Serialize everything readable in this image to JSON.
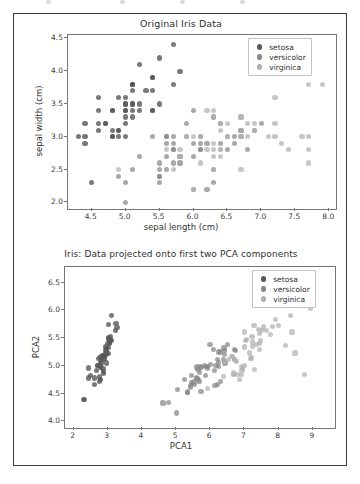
{
  "page": {
    "background_color": "#ffffff",
    "frame_color": "#3a3a3a"
  },
  "series_colors": {
    "setosa": "#585858",
    "versicolor": "#868686",
    "virginica": "#b0b0b0"
  },
  "legend": {
    "items": [
      {
        "label": "setosa",
        "class_index": 0
      },
      {
        "label": "versicolor",
        "class_index": 1
      },
      {
        "label": "virginica",
        "class_index": 2
      }
    ]
  },
  "chart_data": [
    {
      "type": "scatter",
      "title": "Original Iris Data",
      "xlabel": "sepal length (cm)",
      "ylabel": "sepal width (cm)",
      "xlim": [
        4.15,
        8.1
      ],
      "ylim": [
        1.9,
        4.55
      ],
      "xticks": [
        "4.5",
        "5.0",
        "5.5",
        "6.0",
        "6.5",
        "7.0",
        "7.5",
        "8.0"
      ],
      "xtick_values": [
        4.5,
        5.0,
        5.5,
        6.0,
        6.5,
        7.0,
        7.5,
        8.0
      ],
      "yticks": [
        "2.0",
        "2.5",
        "3.0",
        "3.5",
        "4.0",
        "4.5"
      ],
      "ytick_values": [
        2.0,
        2.5,
        3.0,
        3.5,
        4.0,
        4.5
      ],
      "grid": false,
      "legend_position": "upper right",
      "series": [
        {
          "name": "setosa",
          "x": [
            5.1,
            4.9,
            4.7,
            4.6,
            5.0,
            5.4,
            4.6,
            5.0,
            4.4,
            4.9,
            5.4,
            4.8,
            4.8,
            4.3,
            5.8,
            5.7,
            5.4,
            5.1,
            5.7,
            5.1,
            5.4,
            5.1,
            4.6,
            5.1,
            4.8,
            5.0,
            5.0,
            5.2,
            5.2,
            4.7,
            4.8,
            5.4,
            5.2,
            5.5,
            4.9,
            5.0,
            5.5,
            4.9,
            4.4,
            5.1,
            5.0,
            4.5,
            4.4,
            5.0,
            5.1,
            4.8,
            5.1,
            4.6,
            5.3,
            5.0
          ],
          "y": [
            3.5,
            3.0,
            3.2,
            3.1,
            3.6,
            3.9,
            3.4,
            3.4,
            2.9,
            3.1,
            3.7,
            3.4,
            3.0,
            3.0,
            4.0,
            4.4,
            3.9,
            3.5,
            3.8,
            3.8,
            3.4,
            3.7,
            3.6,
            3.3,
            3.4,
            3.0,
            3.4,
            3.5,
            3.4,
            3.2,
            3.1,
            3.4,
            4.1,
            4.2,
            3.1,
            3.2,
            3.5,
            3.6,
            3.0,
            3.4,
            3.5,
            2.3,
            3.2,
            3.5,
            3.8,
            3.0,
            3.8,
            3.2,
            3.7,
            3.3
          ]
        },
        {
          "name": "versicolor",
          "x": [
            7.0,
            6.4,
            6.9,
            5.5,
            6.5,
            5.7,
            6.3,
            4.9,
            6.6,
            5.2,
            5.0,
            5.9,
            6.0,
            6.1,
            5.6,
            6.7,
            5.6,
            5.8,
            6.2,
            5.6,
            5.9,
            6.1,
            6.3,
            6.1,
            6.4,
            6.6,
            6.8,
            6.7,
            6.0,
            5.7,
            5.5,
            5.5,
            5.8,
            6.0,
            5.4,
            6.0,
            6.7,
            6.3,
            5.6,
            5.5,
            5.5,
            6.1,
            5.8,
            5.0,
            5.6,
            5.7,
            5.7,
            6.2,
            5.1,
            5.7
          ],
          "y": [
            3.2,
            3.2,
            3.1,
            2.3,
            2.8,
            2.8,
            3.3,
            2.4,
            2.9,
            2.7,
            2.0,
            3.0,
            2.2,
            2.9,
            2.9,
            3.1,
            3.0,
            2.7,
            2.2,
            2.5,
            3.2,
            2.8,
            2.5,
            2.8,
            2.9,
            3.0,
            2.8,
            3.0,
            2.9,
            2.6,
            2.4,
            2.4,
            2.7,
            2.7,
            3.0,
            3.4,
            3.1,
            2.3,
            3.0,
            2.5,
            2.6,
            3.0,
            2.6,
            2.3,
            2.7,
            3.0,
            2.9,
            2.9,
            2.5,
            2.8
          ]
        },
        {
          "name": "virginica",
          "x": [
            6.3,
            5.8,
            7.1,
            6.3,
            6.5,
            7.6,
            4.9,
            7.3,
            6.7,
            7.2,
            6.5,
            6.4,
            6.8,
            5.7,
            5.8,
            6.4,
            6.5,
            7.7,
            7.7,
            6.0,
            6.9,
            5.6,
            7.7,
            6.3,
            6.7,
            7.2,
            6.2,
            6.1,
            6.4,
            7.2,
            7.4,
            7.9,
            6.4,
            6.3,
            6.1,
            7.7,
            6.3,
            6.4,
            6.0,
            6.9,
            6.7,
            6.9,
            5.8,
            6.8,
            6.7,
            6.7,
            6.3,
            6.5,
            6.2,
            5.9
          ],
          "y": [
            3.3,
            2.7,
            3.0,
            2.9,
            3.0,
            3.0,
            2.5,
            2.9,
            2.5,
            3.6,
            3.2,
            2.7,
            3.0,
            2.5,
            2.8,
            3.2,
            3.0,
            3.8,
            2.6,
            2.2,
            3.2,
            2.8,
            2.8,
            2.7,
            3.3,
            3.2,
            2.8,
            3.0,
            2.8,
            3.0,
            2.8,
            3.8,
            2.8,
            2.8,
            2.6,
            3.0,
            3.4,
            3.1,
            3.0,
            3.1,
            3.1,
            3.1,
            2.7,
            3.2,
            3.3,
            3.0,
            2.5,
            3.0,
            3.4,
            3.0
          ]
        }
      ]
    },
    {
      "type": "scatter",
      "title": "Iris: Data projected onto first two PCA components",
      "xlabel": "PCA1",
      "ylabel": "PCA2",
      "xlim": [
        1.75,
        9.65
      ],
      "ylim": [
        3.88,
        6.78
      ],
      "xticks": [
        "2",
        "3",
        "4",
        "5",
        "6",
        "7",
        "8",
        "9"
      ],
      "xtick_values": [
        2,
        3,
        4,
        5,
        6,
        7,
        8,
        9
      ],
      "yticks": [
        "4.0",
        "4.5",
        "5.0",
        "5.5",
        "6.0",
        "6.5"
      ],
      "ytick_values": [
        4.0,
        4.5,
        5.0,
        5.5,
        6.0,
        6.5
      ],
      "grid": false,
      "legend_position": "upper right",
      "series": [
        {
          "name": "setosa",
          "x": [
            2.82,
            2.79,
            2.61,
            2.75,
            2.78,
            3.23,
            2.69,
            2.88,
            2.62,
            2.87,
            3.05,
            2.89,
            2.75,
            2.29,
            3.08,
            3.24,
            3.02,
            2.84,
            3.27,
            2.93,
            3.1,
            2.93,
            2.44,
            3.03,
            3.02,
            2.97,
            2.96,
            2.97,
            2.93,
            2.8,
            2.86,
            3.07,
            3.02,
            3.12,
            2.88,
            2.7,
            3.05,
            2.74,
            2.43,
            2.89,
            2.78,
            2.31,
            2.49,
            2.95,
            3.09,
            2.79,
            3.03,
            2.67,
            3.01,
            2.87
          ],
          "y": [
            5.05,
            4.75,
            4.78,
            4.8,
            5.08,
            5.64,
            5.0,
            5.17,
            4.66,
            4.86,
            5.43,
            5.14,
            4.72,
            4.4,
            5.45,
            5.76,
            5.5,
            5.18,
            5.69,
            5.35,
            5.46,
            5.29,
            4.96,
            5.22,
            5.33,
            5.05,
            5.26,
            5.31,
            5.18,
            4.97,
            4.95,
            5.48,
            5.75,
            5.91,
            4.9,
            5.01,
            5.41,
            5.13,
            4.78,
            5.19,
            5.16,
            4.39,
            4.83,
            5.23,
            5.53,
            4.99,
            5.49,
            4.91,
            5.4,
            5.12
          ]
        },
        {
          "name": "versicolor",
          "x": [
            6.5,
            6.23,
            6.73,
            5.53,
            6.43,
            5.86,
            6.4,
            4.62,
            6.39,
            5.25,
            5.02,
            5.86,
            5.73,
            6.23,
            5.46,
            6.3,
            5.84,
            5.61,
            6.21,
            5.46,
            6.09,
            5.91,
            6.31,
            6.17,
            6.21,
            6.42,
            6.72,
            6.72,
            5.91,
            5.42,
            5.33,
            5.33,
            5.65,
            6.12,
            5.6,
            5.99,
            6.42,
            6.14,
            5.64,
            5.42,
            5.52,
            6.0,
            5.67,
            4.79,
            5.59,
            5.7,
            5.73,
            6.25,
            5.05,
            5.69
          ],
          "y": [
            5.38,
            5.25,
            5.27,
            4.66,
            5.05,
            4.82,
            5.32,
            4.33,
            5.12,
            4.76,
            4.15,
            4.99,
            4.54,
            5.06,
            4.83,
            5.25,
            5.01,
            4.77,
            4.66,
            4.69,
            5.29,
            4.96,
            4.72,
            5.0,
            5.12,
            5.2,
            5.12,
            5.29,
            4.99,
            4.61,
            4.52,
            4.53,
            4.76,
            4.91,
            4.98,
            5.38,
            5.27,
            4.64,
            4.93,
            4.64,
            4.71,
            5.03,
            4.72,
            4.34,
            4.79,
            4.99,
            4.97,
            4.99,
            4.58,
            4.88
          ]
        },
        {
          "name": "virginica",
          "x": [
            7.23,
            6.67,
            7.77,
            7.01,
            7.43,
            8.35,
            5.91,
            8.0,
            7.3,
            8.04,
            7.04,
            6.94,
            7.44,
            6.38,
            6.73,
            7.22,
            7.15,
            8.69,
            8.76,
            6.86,
            7.64,
            6.42,
            8.48,
            6.93,
            7.4,
            7.92,
            6.76,
            6.65,
            7.18,
            7.82,
            8.21,
            8.93,
            7.2,
            6.91,
            6.91,
            8.39,
            7.28,
            7.06,
            6.54,
            7.48,
            7.44,
            7.36,
            6.67,
            7.5,
            7.55,
            7.23,
            6.78,
            7.0,
            7.0,
            6.62
          ],
          "y": [
            5.43,
            4.87,
            5.56,
            5.0,
            5.29,
            5.91,
            4.59,
            5.72,
            4.93,
            6.13,
            5.45,
            4.95,
            5.4,
            4.81,
            5.1,
            5.53,
            5.23,
            6.13,
            4.85,
            4.75,
            5.63,
            5.08,
            5.23,
            4.92,
            5.66,
            5.84,
            5.08,
            5.17,
            5.13,
            5.71,
            5.36,
            6.04,
            5.14,
            4.99,
            4.85,
            5.61,
            5.73,
            5.48,
            5.12,
            5.45,
            5.58,
            5.39,
            4.85,
            5.64,
            5.7,
            5.35,
            4.84,
            5.34,
            5.61,
            5.17
          ]
        }
      ]
    }
  ]
}
